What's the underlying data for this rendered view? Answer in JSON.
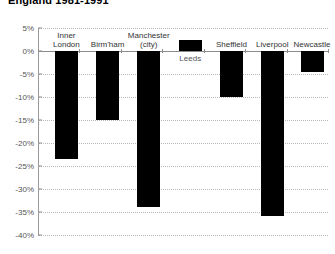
{
  "chart_data": {
    "type": "bar",
    "title": "England 1981-1991",
    "xlabel": "",
    "ylabel": "",
    "ylim": [
      -40,
      5
    ],
    "ytick_values": [
      5,
      0,
      -5,
      -10,
      -15,
      -20,
      -25,
      -30,
      -35,
      -40
    ],
    "ytick_labels": [
      "5%",
      "0%",
      "-5%",
      "-10%",
      "-15%",
      "-20%",
      "-25%",
      "-30%",
      "-35%",
      "-40%"
    ],
    "grid": true,
    "legend": "none",
    "bar_color": "#000000",
    "categories": [
      "Inner London",
      "Birm'ham",
      "Manchester (city)",
      "Leeds",
      "Sheffield",
      "Liverpool",
      "Newcastle"
    ],
    "values": [
      -23.5,
      -15.0,
      -34.0,
      2.5,
      -10.0,
      -35.8,
      -4.5
    ]
  },
  "bars": [
    {
      "label": "Inner\nLondon",
      "value": -23.5,
      "label_position": "above",
      "center_pct": 9.8
    },
    {
      "label": "Birm'ham",
      "value": -15.0,
      "label_position": "above",
      "center_pct": 24.0
    },
    {
      "label": "Manchester\n(city)",
      "value": -34.0,
      "label_position": "above",
      "center_pct": 38.2
    },
    {
      "label": "Leeds",
      "value": 2.5,
      "label_position": "below",
      "center_pct": 52.5
    },
    {
      "label": "Sheffield",
      "value": -10.0,
      "label_position": "above",
      "center_pct": 66.7
    },
    {
      "label": "Liverpool",
      "value": -35.8,
      "label_position": "above",
      "center_pct": 80.8
    },
    {
      "label": "Newcastle",
      "value": -4.5,
      "label_position": "above",
      "center_pct": 94.5
    }
  ]
}
